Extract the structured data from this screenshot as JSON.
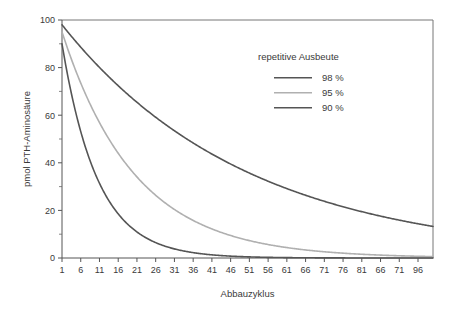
{
  "chart_data": {
    "type": "line",
    "title": "",
    "xlabel": "Abbauzyklus",
    "ylabel": "pmol PTH-Aminosäure",
    "xlim": [
      1,
      100
    ],
    "ylim": [
      0,
      100
    ],
    "grid": false,
    "legend_position": "top-right",
    "legend_title": "repetitive Ausbeute",
    "x_ticks": [
      1,
      6,
      11,
      16,
      21,
      26,
      31,
      36,
      41,
      46,
      51,
      56,
      61,
      66,
      71,
      76,
      81,
      66,
      71,
      96
    ],
    "x_tick_labels": [
      "1",
      "6",
      "11",
      "16",
      "21",
      "26",
      "31",
      "36",
      "41",
      "46",
      "51",
      "56",
      "61",
      "66",
      "71",
      "76",
      "81",
      "66",
      "71",
      "96"
    ],
    "y_ticks": [
      0,
      20,
      40,
      60,
      80,
      100
    ],
    "y_tick_labels": [
      "0",
      "20",
      "40",
      "60",
      "80",
      "100"
    ],
    "y_minor_ticks": [
      10,
      30,
      50,
      70,
      90
    ],
    "series": [
      {
        "name": "98 %",
        "label": "98 %",
        "color": "#555555",
        "initial_value": 98,
        "retention": 0.98,
        "x": [
          1,
          6,
          11,
          16,
          21,
          26,
          31,
          36,
          41,
          46,
          51,
          56,
          61,
          66,
          71,
          76,
          81,
          86,
          91,
          96,
          100
        ],
        "values": [
          98,
          88.6,
          80.1,
          72.4,
          65.5,
          59.2,
          53.5,
          48.4,
          43.7,
          39.5,
          35.7,
          32.3,
          29.2,
          26.4,
          23.9,
          21.6,
          19.5,
          17.6,
          15.9,
          14.4,
          13.3
        ]
      },
      {
        "name": "95 %",
        "label": "95 %",
        "color": "#b0b0b0",
        "initial_value": 95,
        "retention": 0.95,
        "x": [
          1,
          6,
          11,
          16,
          21,
          26,
          31,
          36,
          41,
          46,
          51,
          56,
          61,
          66,
          71,
          76,
          81,
          86,
          91,
          96,
          100
        ],
        "values": [
          95,
          73.5,
          56.8,
          44.0,
          34.0,
          26.3,
          20.4,
          15.7,
          12.2,
          9.4,
          7.3,
          5.6,
          4.4,
          3.4,
          2.6,
          2.0,
          1.6,
          1.2,
          0.9,
          0.7,
          0.6
        ]
      },
      {
        "name": "90 %",
        "label": "90 %",
        "color": "#555555",
        "initial_value": 90,
        "retention": 0.9,
        "x": [
          1,
          6,
          11,
          16,
          21,
          26,
          31,
          36,
          41,
          46,
          51,
          56,
          61,
          66,
          71,
          76,
          81,
          86,
          91,
          96,
          100
        ],
        "values": [
          90,
          53.1,
          31.4,
          18.5,
          10.9,
          6.5,
          3.8,
          2.3,
          1.3,
          0.8,
          0.5,
          0.3,
          0.2,
          0.1,
          0.06,
          0.04,
          0.02,
          0.01,
          0.008,
          0.005,
          0.003
        ]
      }
    ]
  }
}
